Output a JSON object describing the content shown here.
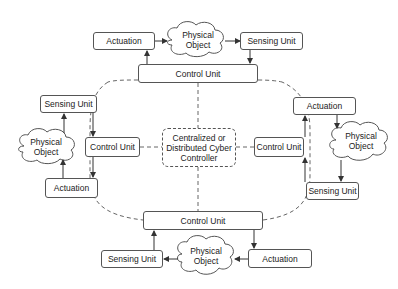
{
  "diagram": {
    "center": {
      "label": "Centralized or Distributed Cyber Controller"
    },
    "top": {
      "actuation": "Actuation",
      "physical_object": "Physical Object",
      "sensing_unit": "Sensing Unit",
      "control_unit": "Control Unit"
    },
    "left": {
      "sensing_unit": "Sensing Unit",
      "physical_object": "Physical Object",
      "control_unit": "Control Unit",
      "actuation": "Actuation"
    },
    "right": {
      "actuation": "Actuation",
      "physical_object": "Physical Object",
      "control_unit": "Control Unit",
      "sensing_unit": "Sensing Unit"
    },
    "bottom": {
      "control_unit": "Control Unit",
      "sensing_unit": "Sensing Unit",
      "physical_object": "Physical Object",
      "actuation": "Actuation"
    },
    "colors": {
      "line": "#444444",
      "box_border": "#555555",
      "text": "#222222"
    }
  }
}
